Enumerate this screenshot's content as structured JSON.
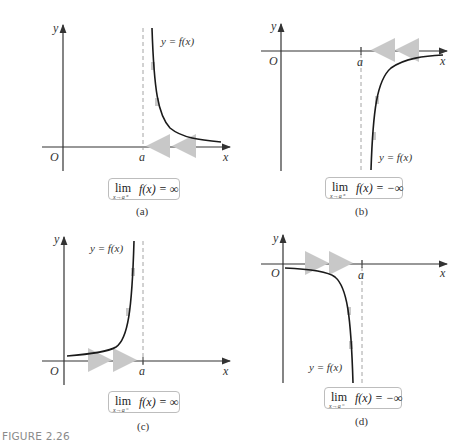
{
  "figure": {
    "label": "FIGURE 2.26",
    "label_color": "#8a8a8a"
  },
  "colors": {
    "axis": "#333333",
    "curve": "#1a1a1a",
    "asymptote": "#9a9a9a",
    "arrow_highlight": "#c8c8c8",
    "box_border": "#bdbdbd"
  },
  "panels": [
    {
      "id": "a",
      "caption": "(a)",
      "axis_y_label": "y",
      "axis_x_label": "x",
      "origin_label": "O",
      "asymptote_label": "a",
      "curve_label": "y = f(x)",
      "limit": {
        "word": "lim",
        "sub": "x→a⁺",
        "expr": "f(x) = ∞"
      }
    },
    {
      "id": "b",
      "caption": "(b)",
      "axis_y_label": "y",
      "axis_x_label": "x",
      "origin_label": "O",
      "asymptote_label": "a",
      "curve_label": "y = f(x)",
      "limit": {
        "word": "lim",
        "sub": "x→a⁺",
        "expr": "f(x) = −∞"
      }
    },
    {
      "id": "c",
      "caption": "(c)",
      "axis_y_label": "y",
      "axis_x_label": "x",
      "origin_label": "O",
      "asymptote_label": "a",
      "curve_label": "y = f(x)",
      "limit": {
        "word": "lim",
        "sub": "x→a⁻",
        "expr": "f(x) = ∞"
      }
    },
    {
      "id": "d",
      "caption": "(d)",
      "axis_y_label": "y",
      "axis_x_label": "x",
      "origin_label": "O",
      "asymptote_label": "a",
      "curve_label": "y = f(x)",
      "limit": {
        "word": "lim",
        "sub": "x→a⁻",
        "expr": "f(x) = −∞"
      }
    }
  ]
}
